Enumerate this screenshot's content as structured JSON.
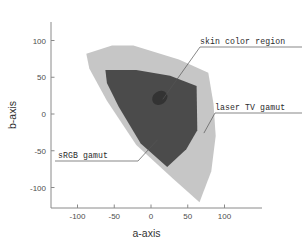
{
  "chart_data": {
    "type": "scatter",
    "title": "",
    "xlabel": "a-axis",
    "ylabel": "b-axis",
    "xlim": [
      -125,
      130
    ],
    "ylim": [
      -125,
      125
    ],
    "xticks": [
      "-100",
      "-50",
      "0",
      "50",
      "100"
    ],
    "xtick_values": [
      -100,
      -50,
      0,
      50,
      100
    ],
    "yticks": [
      "100",
      "50",
      "0",
      "-50",
      "-100"
    ],
    "ytick_values": [
      100,
      50,
      0,
      -50,
      -100
    ],
    "grid": false,
    "legend_position": "annotations",
    "series": [
      {
        "name": "laser TV gamut",
        "kind": "polygon",
        "color": "#c6c6c6",
        "points": [
          [
            -88,
            82
          ],
          [
            -53,
            93
          ],
          [
            -24,
            93
          ],
          [
            38,
            74
          ],
          [
            78,
            56
          ],
          [
            85,
            14
          ],
          [
            88,
            -30
          ],
          [
            82,
            -78
          ],
          [
            66,
            -120
          ],
          [
            30,
            -88
          ],
          [
            -20,
            -42
          ],
          [
            -60,
            18
          ],
          [
            -84,
            62
          ]
        ]
      },
      {
        "name": "sRGB gamut",
        "kind": "polygon",
        "color": "#4b4b4b",
        "points": [
          [
            -62,
            60
          ],
          [
            -20,
            60
          ],
          [
            26,
            52
          ],
          [
            62,
            38
          ],
          [
            63,
            -22
          ],
          [
            48,
            -48
          ],
          [
            22,
            -72
          ],
          [
            -14,
            -40
          ],
          [
            -44,
            10
          ],
          [
            -60,
            42
          ]
        ]
      },
      {
        "name": "skin color region",
        "kind": "ellipse",
        "color": "#333333",
        "center": [
          12,
          22
        ],
        "rx": 11,
        "ry": 9,
        "rotation": -35
      }
    ],
    "annotations": [
      {
        "label": "skin color region",
        "target": [
          16,
          20
        ]
      },
      {
        "label": "laser TV gamut",
        "target": [
          72,
          -26
        ]
      },
      {
        "label": "sRGB gamut",
        "target": [
          9,
          -35
        ]
      }
    ]
  },
  "axes": {
    "x_title": "a-axis",
    "y_title": "b-axis"
  }
}
